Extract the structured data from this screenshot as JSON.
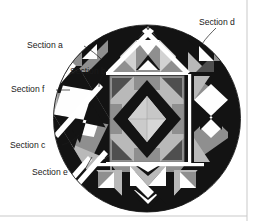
{
  "figure": {
    "type": "quilt-section-diagram",
    "shape": "circle",
    "background_color": "#ffffff",
    "outline_color": "#1a1a1a"
  },
  "palette": {
    "black": "#131313",
    "dark_gray": "#4f4f4f",
    "mid_gray": "#8f8f8f",
    "light_gray": "#b9b9b9",
    "pale_gray": "#d2d2d2",
    "white": "#fefefe",
    "sash_white": "#ffffff",
    "label_text": "#1a1a1a",
    "leader_line": "#1a1a1a",
    "page_rule": "#c9c9c9"
  },
  "labels": [
    {
      "id": "a",
      "text": "Section a",
      "x": 27,
      "y": 48,
      "anchor": "start",
      "leader": [
        [
          84,
          46
        ],
        [
          96,
          54
        ],
        [
          101,
          58
        ]
      ]
    },
    {
      "id": "b",
      "text": "Section b",
      "x": 70,
      "y": 74,
      "anchor": "start",
      "leader": [
        [
          108,
          70
        ],
        [
          101,
          78
        ],
        [
          99,
          86
        ]
      ]
    },
    {
      "id": "c",
      "text": "Section c",
      "x": 10,
      "y": 148,
      "anchor": "start",
      "leader": [
        [
          62,
          145
        ],
        [
          72,
          140
        ],
        [
          78,
          136
        ]
      ]
    },
    {
      "id": "d",
      "text": "Section d",
      "x": 199,
      "y": 25,
      "anchor": "start",
      "leader": [
        [
          215,
          28
        ],
        [
          208,
          36
        ],
        [
          203,
          43
        ]
      ]
    },
    {
      "id": "e",
      "text": "Section e",
      "x": 32,
      "y": 175,
      "anchor": "start",
      "leader": [
        [
          84,
          170
        ],
        [
          88,
          163
        ],
        [
          91,
          158
        ]
      ]
    },
    {
      "id": "f",
      "text": "Section f",
      "x": 11,
      "y": 92,
      "anchor": "start",
      "leader": [
        [
          57,
          90
        ],
        [
          64,
          90
        ],
        [
          69,
          91
        ]
      ]
    }
  ],
  "geometry": {
    "circle": {
      "cx": 147,
      "cy": 118.5,
      "r": 93.5
    },
    "center_block": {
      "x": 110,
      "y": 76,
      "w": 74,
      "h": 86
    },
    "right_block": {
      "x": 194,
      "y": 76,
      "w": 34,
      "h": 86
    },
    "left_block": {
      "x": 66,
      "y": 76,
      "w": 34,
      "h": 86
    },
    "top_band": {
      "x": 96,
      "y": 26,
      "w": 108,
      "h": 46
    },
    "bottom_band": {
      "x": 96,
      "y": 166,
      "w": 108,
      "h": 46
    }
  },
  "page_rules": {
    "right_vertical_x": 247,
    "bottom_horizontal_y": 216
  }
}
